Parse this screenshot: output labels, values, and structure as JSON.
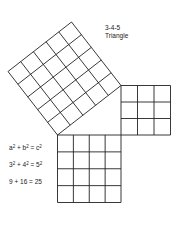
{
  "title": {
    "line1": "3-4-5",
    "line2": "Triangle"
  },
  "equations": [
    {
      "parts": [
        "a",
        "2",
        " + b",
        "2",
        " = c",
        "2"
      ]
    },
    {
      "parts": [
        "3",
        "2",
        " + 4",
        "2",
        " = 5",
        "2"
      ]
    },
    {
      "text": "9  +  16  =  25"
    }
  ],
  "eq1": {
    "a": "a",
    "b": " + b",
    "c": "= c",
    "exp": "2"
  },
  "eq2": {
    "a": "3",
    "b": " + 4",
    "c": "= 5",
    "exp": "2"
  },
  "eq3": {
    "text": "9  +  16  =  25"
  },
  "squares": {
    "hypotenuse": {
      "side_units": 5,
      "label": "c"
    },
    "leg_vertical": {
      "side_units": 3,
      "label": "a"
    },
    "leg_horizontal": {
      "side_units": 4,
      "label": "b"
    }
  },
  "colors": {
    "line": "#222222",
    "background": "#ffffff"
  }
}
